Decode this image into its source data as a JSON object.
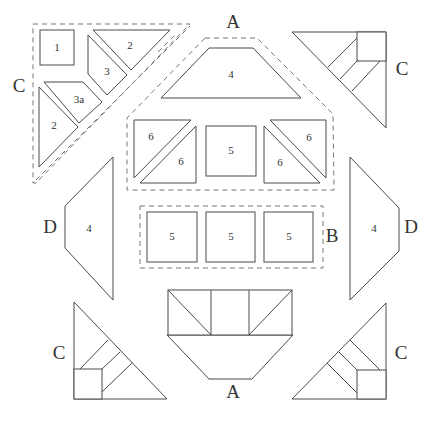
{
  "diagram": {
    "type": "quilt-block-piecing-diagram",
    "unit_labels": {
      "top_left": "C",
      "top": "A",
      "top_right": "C",
      "middle_right": "B",
      "left": "D",
      "right": "D",
      "bottom": "A",
      "bottom_left": "C",
      "bottom_right": "C"
    },
    "piece_numbers": {
      "c_square": "1",
      "c_top_triangle": "2",
      "c_piece_3": "3",
      "c_piece_3a": "3a",
      "c_left_triangle": "2",
      "a_trapezoid": "4",
      "a_left_hst_upper": "6",
      "a_left_hst_lower": "6",
      "a_center_square": "5",
      "a_right_hst_upper": "6",
      "a_right_hst_lower": "6",
      "b_square_1": "5",
      "b_square_2": "5",
      "b_square_3": "5",
      "d_left": "4",
      "d_right": "4"
    },
    "colors": {
      "stroke": "#4a4a4a",
      "dashed": "#777777",
      "background": "#ffffff"
    }
  }
}
